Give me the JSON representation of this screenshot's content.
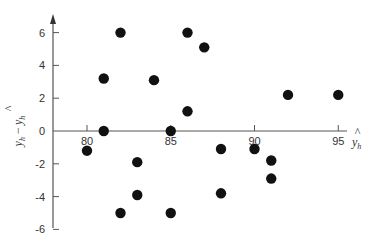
{
  "chart_data": {
    "type": "scatter",
    "title": "",
    "xlabel": "ŷ_h",
    "ylabel": "y_h − ŷ_h",
    "xlabel_display": {
      "hat": "^",
      "main": "y",
      "sub": "h"
    },
    "ylabel_display": {
      "left_main": "y",
      "left_sub": "h",
      "minus": "−",
      "hat": "^",
      "right_main": "y",
      "right_sub": "h"
    },
    "xlim": [
      78,
      97
    ],
    "ylim": [
      -6,
      6.8
    ],
    "xticks": [
      80,
      85,
      90,
      95
    ],
    "yticks": [
      6,
      4,
      2,
      0,
      -2,
      -4,
      -6
    ],
    "xtick_labels": [
      "80",
      "85",
      "90",
      "95"
    ],
    "ytick_labels": [
      "6",
      "4",
      "2",
      "0",
      "-2",
      "-4",
      "-6"
    ],
    "grid": false,
    "legend": null,
    "marker_color": "#111111",
    "axis_color": "#555555",
    "points": [
      {
        "x": 80,
        "y": -1.2
      },
      {
        "x": 81,
        "y": 3.2
      },
      {
        "x": 81,
        "y": 0
      },
      {
        "x": 82,
        "y": 6
      },
      {
        "x": 82,
        "y": -5
      },
      {
        "x": 83,
        "y": -1.9
      },
      {
        "x": 83,
        "y": -3.9
      },
      {
        "x": 84,
        "y": 3.1
      },
      {
        "x": 85,
        "y": 0
      },
      {
        "x": 85,
        "y": -5
      },
      {
        "x": 86,
        "y": 6
      },
      {
        "x": 86,
        "y": 1.2
      },
      {
        "x": 87,
        "y": 5.1
      },
      {
        "x": 88,
        "y": -1.1
      },
      {
        "x": 88,
        "y": -3.8
      },
      {
        "x": 90,
        "y": -1.1
      },
      {
        "x": 91,
        "y": -1.8
      },
      {
        "x": 91,
        "y": -2.9
      },
      {
        "x": 92,
        "y": 2.2
      },
      {
        "x": 95,
        "y": 2.2
      }
    ]
  }
}
